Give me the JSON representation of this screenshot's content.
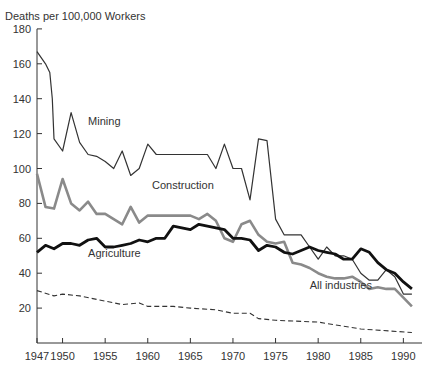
{
  "chart_data": {
    "type": "line",
    "title": "",
    "ylabel": "Deaths per 100,000 Workers",
    "xlabel": "",
    "ylim": [
      0,
      180
    ],
    "xlim": [
      1947,
      1991.5
    ],
    "yticks": [
      20,
      40,
      60,
      80,
      100,
      120,
      140,
      160,
      180
    ],
    "xticks": [
      1947,
      1950,
      1955,
      1960,
      1965,
      1970,
      1975,
      1980,
      1985,
      1990
    ],
    "grid": false,
    "legend": "inline labels",
    "labels": [
      {
        "text": "Mining",
        "x": 1953,
        "y": 125
      },
      {
        "text": "Construction",
        "x": 1960.5,
        "y": 88
      },
      {
        "text": "Agriculture",
        "x": 1953,
        "y": 49
      },
      {
        "text": "All industries",
        "x": 1979,
        "y": 31
      }
    ],
    "series": [
      {
        "name": "Mining",
        "style": "thin-dark",
        "x": [
          1947,
          1948,
          1948.5,
          1948.8,
          1949,
          1950,
          1951,
          1952,
          1953,
          1954,
          1955,
          1956,
          1957,
          1958,
          1959,
          1960,
          1961,
          1962,
          1963,
          1964,
          1965,
          1966,
          1967,
          1968,
          1969,
          1970,
          1971,
          1972,
          1973,
          1974,
          1975,
          1976,
          1977,
          1978,
          1979,
          1980,
          1981,
          1982,
          1983,
          1984,
          1985,
          1986,
          1987,
          1988,
          1989,
          1990,
          1991
        ],
        "values": [
          167,
          160,
          155,
          140,
          117,
          110,
          132,
          115,
          108,
          107,
          104,
          100,
          110,
          96,
          100,
          114,
          108,
          108,
          108,
          108,
          108,
          108,
          108,
          100,
          114,
          100,
          100,
          82,
          117,
          116,
          71,
          62,
          62,
          62,
          55,
          48,
          55,
          50,
          50,
          48,
          40,
          36,
          36,
          42,
          38,
          28,
          28
        ]
      },
      {
        "name": "Construction",
        "style": "thick-gray",
        "x": [
          1947,
          1948,
          1949,
          1950,
          1951,
          1952,
          1953,
          1954,
          1955,
          1956,
          1957,
          1958,
          1959,
          1960,
          1961,
          1962,
          1963,
          1964,
          1965,
          1966,
          1967,
          1968,
          1969,
          1970,
          1971,
          1972,
          1973,
          1974,
          1975,
          1976,
          1977,
          1978,
          1979,
          1980,
          1981,
          1982,
          1983,
          1984,
          1985,
          1986,
          1987,
          1988,
          1989,
          1990,
          1991
        ],
        "values": [
          97,
          78,
          77,
          94,
          80,
          76,
          81,
          74,
          74,
          71,
          68,
          78,
          69,
          73,
          73,
          73,
          73,
          73,
          73,
          71,
          74,
          70,
          60,
          58,
          68,
          70,
          62,
          58,
          57,
          58,
          46,
          45,
          43,
          40,
          38,
          37,
          37,
          38,
          35,
          31,
          32,
          31,
          31,
          26,
          21
        ]
      },
      {
        "name": "Agriculture",
        "style": "thick-black",
        "x": [
          1947,
          1948,
          1949,
          1950,
          1951,
          1952,
          1953,
          1954,
          1955,
          1956,
          1957,
          1958,
          1959,
          1960,
          1961,
          1962,
          1963,
          1964,
          1965,
          1966,
          1967,
          1968,
          1969,
          1970,
          1971,
          1972,
          1973,
          1974,
          1975,
          1976,
          1977,
          1978,
          1979,
          1980,
          1981,
          1982,
          1983,
          1984,
          1985,
          1986,
          1987,
          1988,
          1989,
          1990,
          1991
        ],
        "values": [
          52,
          56,
          54,
          57,
          57,
          56,
          59,
          60,
          55,
          55,
          56,
          57,
          59,
          58,
          60,
          60,
          67,
          66,
          65,
          68,
          67,
          66,
          65,
          60,
          60,
          59,
          53,
          56,
          55,
          52,
          51,
          53,
          55,
          53,
          52,
          51,
          48,
          48,
          54,
          52,
          46,
          42,
          40,
          35,
          31
        ]
      },
      {
        "name": "All industries",
        "style": "dashed",
        "x": [
          1947,
          1949,
          1950,
          1952,
          1955,
          1957,
          1959,
          1960,
          1963,
          1965,
          1968,
          1970,
          1972,
          1973,
          1975,
          1980,
          1985,
          1991
        ],
        "values": [
          30,
          27,
          28,
          27,
          24,
          22,
          23,
          21,
          21,
          20,
          19,
          17,
          17,
          14,
          13,
          12,
          8,
          6
        ]
      }
    ]
  },
  "caption": "Figure — Work-related deaths"
}
